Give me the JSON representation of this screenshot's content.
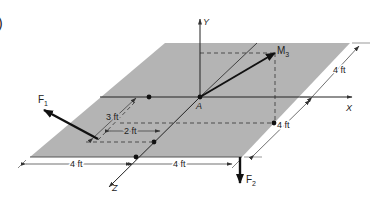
{
  "figure": {
    "panel_marker": ")",
    "plate_color": "#b4b4b4",
    "line_color": "#1a1a1a",
    "axes": {
      "y_label": "Y",
      "x_label": "X",
      "z_label": "Z",
      "origin_label": "A"
    },
    "vectors": {
      "moment_label": "M",
      "moment_sub": "3",
      "force1_label": "F",
      "force1_sub": "1",
      "force2_label": "F",
      "force2_sub": "2"
    },
    "dimensions": {
      "right_top": "4 ft",
      "right_bottom": "4 ft",
      "bottom_left": "4 ft",
      "bottom_right": "4 ft",
      "f1_depth": "3 ft",
      "f1_offset": "2 ft"
    }
  }
}
